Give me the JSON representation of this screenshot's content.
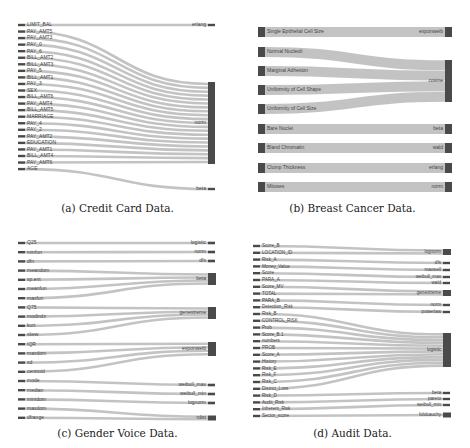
{
  "colors": {
    "node": "#4a4a4a",
    "link": "#b8b8b8",
    "text": "#444444",
    "caption": "#222222"
  },
  "panels": [
    {
      "id": "a",
      "caption": "(a) Credit Card Data.",
      "sources": [
        "LIMIT_BAL",
        "PAY_AMT5",
        "PAY_AMT3",
        "PAY_0",
        "PAY_6",
        "BILL_AMT2",
        "BILL_AMT3",
        "PAY_5",
        "BILL_AMT1",
        "PAY_3",
        "SEX",
        "BILL_AMT6",
        "PAY_AMT4",
        "BILL_AMT5",
        "MARRIAGE",
        "PAY_4",
        "PAY_2",
        "PAY_AMT2",
        "EDUCATION",
        "PAY_AMT1",
        "BILL_AMT4",
        "PAY_AMT6",
        "AGE"
      ],
      "targets": [
        "erlang",
        "norm",
        "beta"
      ],
      "links": {
        "LIMIT_BAL": "erlang",
        "AGE": "beta",
        "default": "norm"
      }
    },
    {
      "id": "b",
      "caption": "(b) Breast Cancer Data.",
      "sources": [
        "Single Epithelial Cell Size",
        "Normal Nucleoli",
        "Marginal Adhesion",
        "Uniformity of Cell Shape",
        "Uniformity of Cell Size",
        "Bare Nuclei",
        "Bland Chromatin",
        "Clump Thickness",
        "Mitoses"
      ],
      "targets": [
        "exponweib",
        "cosine",
        "beta",
        "wald",
        "erlang",
        "norm"
      ],
      "links": {
        "Single Epithelial Cell Size": "exponweib",
        "Normal Nucleoli": "cosine",
        "Marginal Adhesion": "cosine",
        "Uniformity of Cell Shape": "cosine",
        "Uniformity of Cell Size": "cosine",
        "Bare Nuclei": "beta",
        "Bland Chromatin": "wald",
        "Clump Thickness": "erlang",
        "Mitoses": "norm"
      }
    },
    {
      "id": "c",
      "caption": "(c) Gender Voice Data.",
      "sources": [
        "Q25",
        "minfun",
        "dfn",
        "meandom",
        "sp.ent",
        "meanfun",
        "maxfun",
        "Q75",
        "modindx",
        "kurt",
        "skew",
        "IQR",
        "maxdom",
        "sd",
        "centroid",
        "mode",
        "median",
        "minidom",
        "maxdom",
        "dfrange"
      ],
      "targets": [
        "logistic",
        "norm",
        "dfs",
        "beta",
        "genextreme",
        "exponweib",
        "weibull_max",
        "weibull_min",
        "lognorm",
        "rdist"
      ]
    },
    {
      "id": "d",
      "caption": "(d) Audit Data.",
      "sources": [
        "Score_B",
        "LOCATION_ID",
        "Risk_A",
        "Money_Value",
        "Score",
        "PARA_A",
        "Score_MV",
        "TOTAL",
        "PARA_B",
        "Detection_Risk",
        "Risk_B",
        "CONTROL_RISK",
        "Prob",
        "Score_B.1",
        "numbers",
        "PROB",
        "Score_A",
        "History",
        "Risk_E",
        "Risk_F",
        "Risk_C",
        "District_Loss",
        "Risk_D",
        "Audit_Risk",
        "Inherent_Risk",
        "Sector_score"
      ],
      "targets": [
        "lognorm",
        "dfs",
        "maxwell",
        "weibull_max",
        "wald",
        "genextreme",
        "norm",
        "powerlaw",
        "logistic",
        "beta",
        "pareto",
        "weibull_min",
        "foldcauchy"
      ]
    }
  ]
}
